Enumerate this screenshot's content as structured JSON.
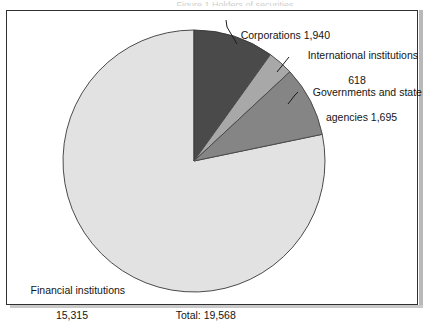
{
  "figure": {
    "background": "#ffffff",
    "panel_border_color": "#303030",
    "top_cropped_caption": "Figure 1   Holders of securities"
  },
  "chart_data": {
    "type": "pie",
    "title": "",
    "total_label": "Total: 19,568",
    "total_value": 19568,
    "legend_position": "callout-labels",
    "units": "count",
    "categories": [
      "Corporations",
      "International institutions",
      "Governments and state agencies",
      "Financial institutions"
    ],
    "values": [
      1940,
      618,
      1695,
      15315
    ],
    "value_labels": [
      "1,940",
      "618",
      "1,695",
      "15,315"
    ],
    "colors": [
      "#4a4a4a",
      "#a8a8a8",
      "#858585",
      "#e2e2e2"
    ],
    "start_angle_deg": 0,
    "direction": "clockwise",
    "slice_angles_deg": [
      35.69,
      11.37,
      31.19,
      281.75
    ],
    "slices": [
      {
        "name": "Corporations",
        "value": 1940,
        "value_label": "1,940",
        "color": "#4a4a4a",
        "percent": 9.9
      },
      {
        "name": "International institutions",
        "value": 618,
        "value_label": "618",
        "color": "#a8a8a8",
        "percent": 3.2
      },
      {
        "name": "Governments and state agencies",
        "value": 1695,
        "value_label": "1,695",
        "color": "#858585",
        "percent": 8.7
      },
      {
        "name": "Financial institutions",
        "value": 15315,
        "value_label": "15,315",
        "color": "#e2e2e2",
        "percent": 78.3
      }
    ]
  },
  "labels": {
    "corporations": {
      "line1": "Corporations 1,940"
    },
    "international": {
      "line1": "International institutions",
      "line2": "618"
    },
    "governments": {
      "line1": "Governments and state",
      "line2": "agencies 1,695"
    },
    "financial": {
      "line1": "Financial institutions",
      "line2": "15,315"
    },
    "total": {
      "text": "Total: 19,568"
    }
  }
}
